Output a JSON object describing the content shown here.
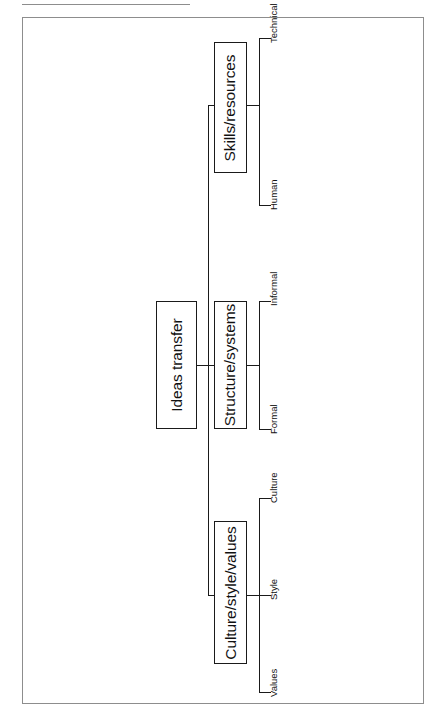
{
  "figure": {
    "orientation": "rotated-90-ccw",
    "line_color": "#1a1a1a",
    "frame_color": "#8d8d8d",
    "background": "#ffffff"
  },
  "diagram": {
    "type": "hierarchy-tree",
    "root": {
      "label": "Ideas transfer"
    },
    "branches": [
      {
        "label": "Skills/resources",
        "leaves": [
          {
            "label": "Human"
          },
          {
            "label": "Technical"
          }
        ]
      },
      {
        "label": "Structure/systems",
        "leaves": [
          {
            "label": "Formal"
          },
          {
            "label": "Informal"
          }
        ]
      },
      {
        "label": "Culture/style/values",
        "leaves": [
          {
            "label": "Values"
          },
          {
            "label": "Style"
          },
          {
            "label": "Culture"
          }
        ]
      }
    ]
  }
}
